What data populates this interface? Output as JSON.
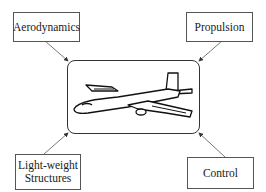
{
  "diagram": {
    "type": "concept-diagram",
    "center": {
      "label": "airplane-illustration",
      "icon": "airplane-icon"
    },
    "nodes": [
      {
        "id": "aerodynamics",
        "label": "Aerodynamics",
        "position": "top-left"
      },
      {
        "id": "propulsion",
        "label": "Propulsion",
        "position": "top-right"
      },
      {
        "id": "structures",
        "label_line1": "Light-weight",
        "label_line2": "Structures",
        "position": "bottom-left"
      },
      {
        "id": "control",
        "label": "Control",
        "position": "bottom-right"
      }
    ],
    "edges": [
      {
        "from": "aerodynamics",
        "to": "center"
      },
      {
        "from": "propulsion",
        "to": "center"
      },
      {
        "from": "structures",
        "to": "center"
      },
      {
        "from": "control",
        "to": "center"
      }
    ],
    "colors": {
      "line": "#444444",
      "background": "#ffffff",
      "text": "#1a1a1a"
    }
  }
}
